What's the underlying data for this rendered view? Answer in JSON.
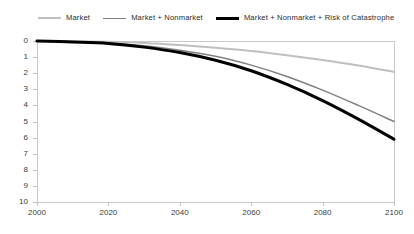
{
  "chart_data": {
    "type": "line",
    "title": "",
    "xlabel": "",
    "ylabel": "",
    "xlim": [
      2000,
      2100
    ],
    "ylim": [
      0,
      10
    ],
    "y_axis_inverted": true,
    "grid": false,
    "legend_position": "top",
    "x_ticks": [
      "2000",
      "2020",
      "2040",
      "2060",
      "2080",
      "2100"
    ],
    "y_ticks": [
      "0",
      "1",
      "2",
      "3",
      "4",
      "5",
      "6",
      "7",
      "8",
      "9",
      "10"
    ],
    "x": [
      2000,
      2010,
      2020,
      2030,
      2040,
      2050,
      2060,
      2070,
      2080,
      2090,
      2100
    ],
    "series": [
      {
        "name": "Market",
        "color": "#bfbfbf",
        "width": 2.0,
        "values": [
          0.0,
          0.02,
          0.05,
          0.12,
          0.25,
          0.42,
          0.62,
          0.88,
          1.18,
          1.52,
          1.92
        ]
      },
      {
        "name": "Market + Nonmarket",
        "color": "#808080",
        "width": 1.5,
        "values": [
          0.0,
          0.05,
          0.12,
          0.3,
          0.58,
          0.95,
          1.5,
          2.2,
          3.05,
          4.0,
          5.0
        ]
      },
      {
        "name": "Market + Nonmarket + Risk of Catastrophe",
        "color": "#000000",
        "width": 3.0,
        "values": [
          0.0,
          0.06,
          0.15,
          0.38,
          0.72,
          1.2,
          1.85,
          2.7,
          3.7,
          4.85,
          6.1
        ]
      }
    ]
  },
  "legend": {
    "items": [
      {
        "label": "Market",
        "color": "#bfbfbf",
        "thickness": "2px"
      },
      {
        "label": "Market + Nonmarket",
        "color": "#808080",
        "thickness": "1.6px"
      },
      {
        "label": "Market + Nonmarket + Risk of Catastrophe",
        "color": "#000000",
        "thickness": "3px"
      }
    ]
  },
  "axes": {
    "y_tick_labels": [
      "0",
      "1",
      "2",
      "3",
      "4",
      "5",
      "6",
      "7",
      "8",
      "9",
      "10"
    ],
    "x_tick_labels": [
      "2000",
      "2020",
      "2040",
      "2060",
      "2080",
      "2100"
    ]
  }
}
